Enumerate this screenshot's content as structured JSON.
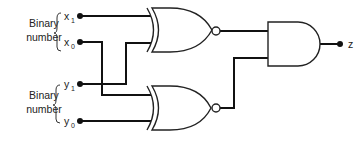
{
  "diagram": {
    "type": "logic-circuit",
    "groups": [
      {
        "label_line1": "Binary",
        "label_line2": "number"
      },
      {
        "label_line1": "Binary",
        "label_line2": "number"
      }
    ],
    "inputs": [
      {
        "base": "x",
        "sub": "1"
      },
      {
        "base": "x",
        "sub": "0"
      },
      {
        "base": "y",
        "sub": "1"
      },
      {
        "base": "y",
        "sub": "0"
      }
    ],
    "gates": [
      {
        "name": "XNOR",
        "inputs": [
          "x1",
          "y1"
        ]
      },
      {
        "name": "XNOR",
        "inputs": [
          "x0",
          "y0"
        ]
      },
      {
        "name": "AND",
        "inputs": [
          "XNOR1",
          "XNOR2"
        ]
      }
    ],
    "output": {
      "label": "z"
    },
    "colors": {
      "line": "#111111",
      "background": "#ffffff"
    }
  }
}
